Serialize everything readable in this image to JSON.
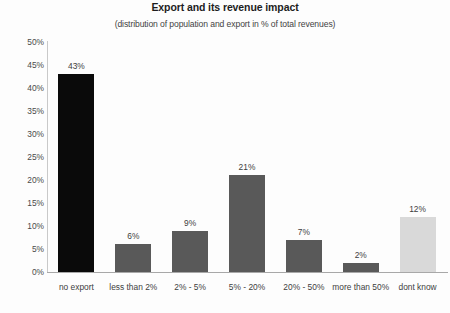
{
  "chart_data": {
    "type": "bar",
    "title": "Export and its revenue impact",
    "subtitle": "(distribution of population and export in % of total revenues)",
    "xlabel": "",
    "ylabel": "",
    "ylim": [
      0,
      50
    ],
    "ytick_step": 5,
    "grid": false,
    "legend": "none",
    "value_suffix": "%",
    "categories": [
      "no export",
      "less than 2%",
      "2% - 5%",
      "5% - 20%",
      "20% - 50%",
      "more than 50%",
      "dont know"
    ],
    "values": [
      43,
      6,
      9,
      21,
      7,
      2,
      12
    ],
    "value_labels": [
      "43%",
      "6%",
      "9%",
      "21%",
      "7%",
      "2%",
      "12%"
    ],
    "ytick_labels": [
      "50%",
      "45%",
      "40%",
      "35%",
      "30%",
      "25%",
      "20%",
      "15%",
      "10%",
      "5%",
      "0%"
    ],
    "ytick_values": [
      50,
      45,
      40,
      35,
      30,
      25,
      20,
      15,
      10,
      5,
      0
    ],
    "bar_colors": [
      "#0a0a0a",
      "#595959",
      "#595959",
      "#595959",
      "#595959",
      "#595959",
      "#d9d9d9"
    ]
  },
  "colors": {
    "background": "#fdfdfd",
    "axis": "#a8a8a8",
    "text": "#3d3d3d",
    "bar_black": "#0a0a0a",
    "bar_dark_gray": "#595959",
    "bar_light_gray": "#d9d9d9"
  }
}
